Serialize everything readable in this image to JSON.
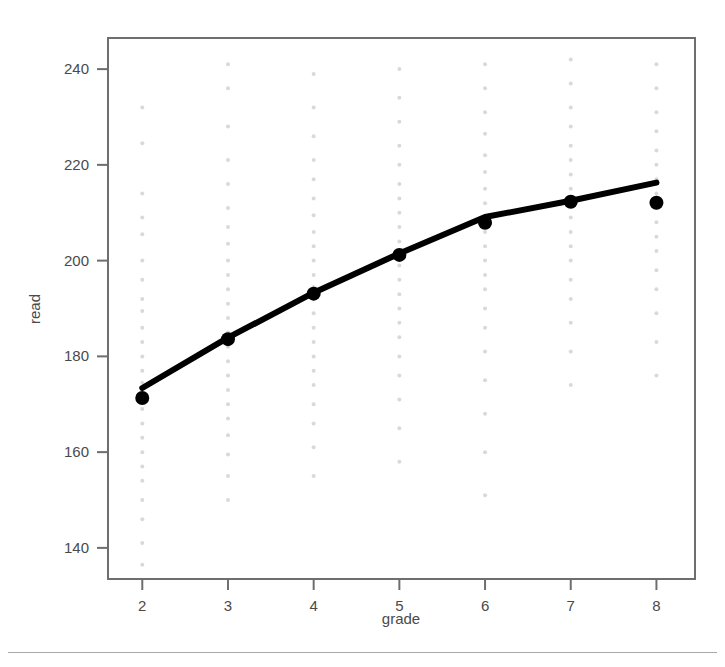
{
  "chart_data": {
    "type": "scatter",
    "title": "",
    "subtitle": "",
    "xlabel": "grade",
    "ylabel": "read",
    "xlim": [
      1.6,
      8.45
    ],
    "ylim": [
      133.5,
      246.5
    ],
    "xticks": [
      2,
      3,
      4,
      5,
      6,
      7,
      8
    ],
    "xtick_labels": [
      "2",
      "3",
      "4",
      "5",
      "6",
      "7",
      "8"
    ],
    "yticks": [
      140,
      160,
      180,
      200,
      220,
      240
    ],
    "ytick_labels": [
      "140",
      "160",
      "180",
      "200",
      "220",
      "240"
    ],
    "grid": false,
    "legend": null,
    "legend_position": "none",
    "frame": true,
    "annotations": [],
    "series": [
      {
        "name": "mean read score",
        "marker": "filled-circle",
        "marker_color": "#000000",
        "marker_size": 7,
        "x": [
          2,
          3,
          4,
          5,
          6,
          7,
          8
        ],
        "values": [
          171.3,
          183.6,
          193.1,
          201.2,
          207.9,
          212.3,
          212.1
        ]
      },
      {
        "name": "fitted trend line",
        "type": "line",
        "line_color": "#000000",
        "line_width": 6,
        "x": [
          2,
          3,
          4,
          5,
          6,
          7,
          8
        ],
        "values": [
          173.4,
          183.9,
          193.3,
          201.5,
          209.1,
          212.5,
          216.3
        ]
      },
      {
        "name": "observed read scores",
        "type": "scatter",
        "marker": "dot",
        "marker_color": "#d9d9d9",
        "marker_size": 2,
        "points": [
          [
            2,
            232.0
          ],
          [
            2,
            224.5
          ],
          [
            2,
            214.0
          ],
          [
            2,
            209.0
          ],
          [
            2,
            205.5
          ],
          [
            2,
            200.0
          ],
          [
            2,
            196.0
          ],
          [
            2,
            192.0
          ],
          [
            2,
            189.5
          ],
          [
            2,
            186.0
          ],
          [
            2,
            183.0
          ],
          [
            2,
            180.0
          ],
          [
            2,
            177.0
          ],
          [
            2,
            174.5
          ],
          [
            2,
            172.0
          ],
          [
            2,
            169.0
          ],
          [
            2,
            166.0
          ],
          [
            2,
            163.0
          ],
          [
            2,
            160.0
          ],
          [
            2,
            157.0
          ],
          [
            2,
            154.0
          ],
          [
            2,
            150.0
          ],
          [
            2,
            146.0
          ],
          [
            2,
            141.0
          ],
          [
            2,
            136.5
          ],
          [
            3,
            241.0
          ],
          [
            3,
            236.0
          ],
          [
            3,
            228.0
          ],
          [
            3,
            221.0
          ],
          [
            3,
            216.0
          ],
          [
            3,
            211.0
          ],
          [
            3,
            207.0
          ],
          [
            3,
            203.5
          ],
          [
            3,
            200.0
          ],
          [
            3,
            197.0
          ],
          [
            3,
            194.0
          ],
          [
            3,
            191.0
          ],
          [
            3,
            188.0
          ],
          [
            3,
            185.0
          ],
          [
            3,
            182.0
          ],
          [
            3,
            179.0
          ],
          [
            3,
            176.0
          ],
          [
            3,
            173.0
          ],
          [
            3,
            170.0
          ],
          [
            3,
            167.0
          ],
          [
            3,
            163.5
          ],
          [
            3,
            159.5
          ],
          [
            3,
            155.0
          ],
          [
            3,
            150.0
          ],
          [
            4,
            239.0
          ],
          [
            4,
            232.0
          ],
          [
            4,
            226.0
          ],
          [
            4,
            221.0
          ],
          [
            4,
            217.0
          ],
          [
            4,
            213.0
          ],
          [
            4,
            209.5
          ],
          [
            4,
            206.0
          ],
          [
            4,
            203.0
          ],
          [
            4,
            200.0
          ],
          [
            4,
            197.0
          ],
          [
            4,
            194.5
          ],
          [
            4,
            192.0
          ],
          [
            4,
            189.0
          ],
          [
            4,
            186.0
          ],
          [
            4,
            183.0
          ],
          [
            4,
            180.0
          ],
          [
            4,
            177.0
          ],
          [
            4,
            174.0
          ],
          [
            4,
            170.0
          ],
          [
            4,
            166.0
          ],
          [
            4,
            161.0
          ],
          [
            4,
            155.0
          ],
          [
            5,
            240.0
          ],
          [
            5,
            234.0
          ],
          [
            5,
            229.0
          ],
          [
            5,
            224.0
          ],
          [
            5,
            220.0
          ],
          [
            5,
            216.0
          ],
          [
            5,
            213.0
          ],
          [
            5,
            210.0
          ],
          [
            5,
            207.0
          ],
          [
            5,
            204.0
          ],
          [
            5,
            201.5
          ],
          [
            5,
            199.0
          ],
          [
            5,
            196.0
          ],
          [
            5,
            193.0
          ],
          [
            5,
            190.0
          ],
          [
            5,
            187.0
          ],
          [
            5,
            184.0
          ],
          [
            5,
            180.0
          ],
          [
            5,
            176.0
          ],
          [
            5,
            171.0
          ],
          [
            5,
            165.0
          ],
          [
            5,
            158.0
          ],
          [
            6,
            241.0
          ],
          [
            6,
            236.0
          ],
          [
            6,
            231.0
          ],
          [
            6,
            226.5
          ],
          [
            6,
            222.0
          ],
          [
            6,
            218.5
          ],
          [
            6,
            215.0
          ],
          [
            6,
            212.0
          ],
          [
            6,
            209.0
          ],
          [
            6,
            206.0
          ],
          [
            6,
            203.0
          ],
          [
            6,
            200.0
          ],
          [
            6,
            197.0
          ],
          [
            6,
            194.0
          ],
          [
            6,
            190.0
          ],
          [
            6,
            186.0
          ],
          [
            6,
            181.0
          ],
          [
            6,
            175.0
          ],
          [
            6,
            168.0
          ],
          [
            6,
            160.0
          ],
          [
            6,
            151.0
          ],
          [
            7,
            242.0
          ],
          [
            7,
            237.0
          ],
          [
            7,
            232.0
          ],
          [
            7,
            228.0
          ],
          [
            7,
            224.0
          ],
          [
            7,
            221.0
          ],
          [
            7,
            218.0
          ],
          [
            7,
            215.0
          ],
          [
            7,
            212.0
          ],
          [
            7,
            209.0
          ],
          [
            7,
            206.0
          ],
          [
            7,
            203.0
          ],
          [
            7,
            200.0
          ],
          [
            7,
            196.0
          ],
          [
            7,
            192.0
          ],
          [
            7,
            187.0
          ],
          [
            7,
            181.0
          ],
          [
            7,
            174.0
          ],
          [
            8,
            241.0
          ],
          [
            8,
            236.0
          ],
          [
            8,
            231.0
          ],
          [
            8,
            227.0
          ],
          [
            8,
            223.0
          ],
          [
            8,
            220.0
          ],
          [
            8,
            217.0
          ],
          [
            8,
            214.0
          ],
          [
            8,
            211.0
          ],
          [
            8,
            208.0
          ],
          [
            8,
            205.0
          ],
          [
            8,
            202.0
          ],
          [
            8,
            198.0
          ],
          [
            8,
            194.0
          ],
          [
            8,
            189.0
          ],
          [
            8,
            183.0
          ],
          [
            8,
            176.0
          ]
        ]
      }
    ]
  },
  "colors": {
    "frame": "#6e6e6e",
    "tick": "#6e6e6e",
    "text": "#4a4a4a",
    "line": "#0a0a0a",
    "point": "#000000",
    "scatter": "#dcdcdc",
    "background": "#ffffff",
    "rule": "#9a9a9a"
  }
}
